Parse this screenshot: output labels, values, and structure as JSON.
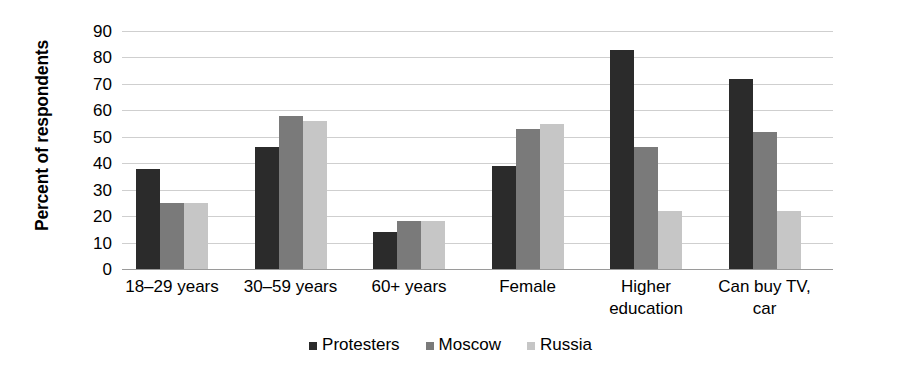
{
  "chart_data": {
    "type": "bar",
    "title": "",
    "xlabel": "",
    "ylabel": "Percent of respondents",
    "ylim": [
      0,
      90
    ],
    "ytick_step": 10,
    "yticks": [
      90,
      80,
      70,
      60,
      50,
      40,
      30,
      20,
      10,
      0
    ],
    "grid": true,
    "legend_position": "bottom",
    "categories": [
      "18–29 years",
      "30–59 years",
      "60+ years",
      "Female",
      "Higher\neducation",
      "Can buy TV,\ncar"
    ],
    "category_lines": [
      [
        "18–29 years"
      ],
      [
        "30–59 years"
      ],
      [
        "60+ years"
      ],
      [
        "Female"
      ],
      [
        "Higher",
        "education"
      ],
      [
        "Can buy TV,",
        "car"
      ]
    ],
    "series": [
      {
        "name": "Protesters",
        "color": "#2b2b2b",
        "values": [
          38,
          46,
          14,
          39,
          83,
          72
        ]
      },
      {
        "name": "Moscow",
        "color": "#7a7a7a",
        "values": [
          25,
          58,
          18,
          53,
          46,
          52
        ]
      },
      {
        "name": "Russia",
        "color": "#c6c6c6",
        "values": [
          25,
          56,
          18,
          55,
          22,
          22
        ]
      }
    ]
  },
  "axis": {
    "y_title": "Percent of respondents"
  },
  "colors": {
    "protesters": "#2b2b2b",
    "moscow": "#7a7a7a",
    "russia": "#c6c6c6",
    "gridline": "#cfcfcf",
    "baseline": "#9a9a9a",
    "background": "#ffffff"
  }
}
